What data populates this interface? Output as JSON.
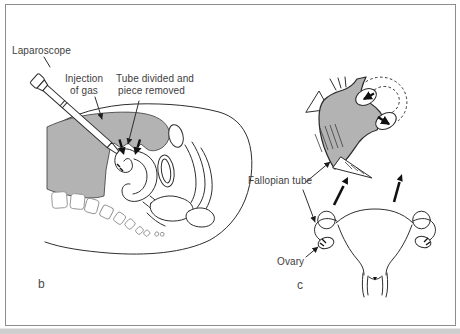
{
  "colors": {
    "gas_fill": "#b3b3b3",
    "ink": "#2e2e2e",
    "frame_border": "#8d8d8d",
    "page_edge": "#cfcfcf"
  },
  "panel_b": {
    "letter": "b",
    "labels": {
      "laparoscope": "Laparoscope",
      "injection_line1": "Injection",
      "injection_line2": "of gas",
      "tube_divided_line1": "Tube divided and",
      "tube_divided_line2": "piece removed"
    }
  },
  "panel_c": {
    "letter": "c",
    "labels": {
      "fallopian_tube": "Fallopian tube",
      "ovary": "Ovary"
    }
  }
}
